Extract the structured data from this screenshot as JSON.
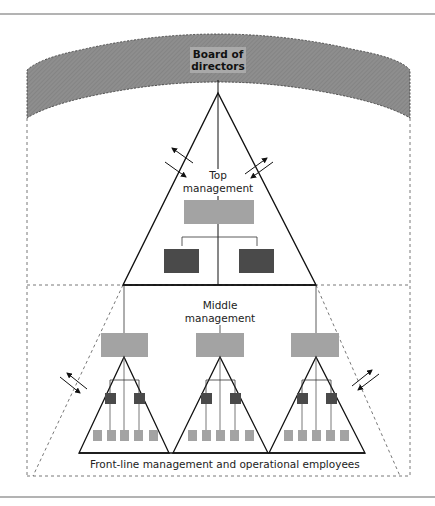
{
  "diagram": {
    "type": "organizational-hierarchy",
    "labels": {
      "board": "Board of directors",
      "board_line1": "Board of",
      "board_line2": "directors",
      "top_line1": "Top",
      "top_line2": "management",
      "middle_line1": "Middle",
      "middle_line2": "management",
      "frontline": "Front-line management and operational employees"
    },
    "levels": [
      {
        "name": "Board of directors",
        "shape": "hatched arc band"
      },
      {
        "name": "Top management",
        "boxes": 3
      },
      {
        "name": "Middle management",
        "boxes": 3
      },
      {
        "name": "Front-line management and operational employees",
        "groups": 3,
        "supervisors_per_group": 2,
        "employees_per_group": 5
      }
    ],
    "colors": {
      "band": "#8c8c8c",
      "light_box": "#a3a3a3",
      "dark_box": "#4a4a4a",
      "line": "#1a1a1a",
      "rule": "#9a9a9a"
    }
  }
}
